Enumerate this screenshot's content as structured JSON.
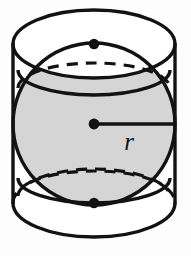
{
  "figure": {
    "name": "sphere-inscribed-in-cylinder",
    "background_color": "#fdfdfd",
    "labels": {
      "radius": "r"
    },
    "colors": {
      "outline": "#121212",
      "sphere_fill": "#d5d5d5",
      "cylinder_fill": "#ffffff",
      "marker": "#121212"
    },
    "geometry": {
      "cylinder": {
        "left_x": 14,
        "right_x": 176,
        "top_center_y": 44,
        "bottom_center_y": 203,
        "ellipse_rx": 81,
        "ellipse_ry": 34
      },
      "sphere": {
        "center_x": 94,
        "center_y": 124,
        "radius": 81
      },
      "radius_segment": {
        "from_x": 94,
        "from_y": 124,
        "to_x": 176,
        "to_y": 124
      },
      "markers": [
        {
          "name": "top-tangent-point",
          "x": 94,
          "y": 44
        },
        {
          "name": "sphere-center-point",
          "x": 94,
          "y": 124
        },
        {
          "name": "bottom-tangent-point",
          "x": 94,
          "y": 203
        }
      ],
      "latitude_circles": [
        {
          "name": "upper-latitude",
          "center_y": 70,
          "rx": 76,
          "ry": 25
        },
        {
          "name": "lower-latitude",
          "center_y": 178,
          "rx": 76,
          "ry": 25
        }
      ]
    },
    "label_position": {
      "radius_x": 129,
      "radius_y": 150
    }
  }
}
